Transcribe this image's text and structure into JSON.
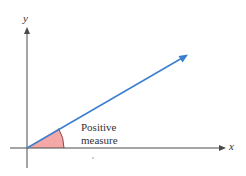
{
  "diagram": {
    "type": "angle-in-standard-position",
    "axes": {
      "x_label": "x",
      "y_label": "y"
    },
    "angle": {
      "label_line1": "Positive",
      "label_line2": "measure",
      "direction": "counterclockwise",
      "approx_degrees": 32
    },
    "colors": {
      "axis": "#4a4a4a",
      "ray": "#3a7fd0",
      "angle_fill": "#f4a9a8",
      "angle_arc": "#8a4a4a",
      "text": "#333333"
    }
  }
}
